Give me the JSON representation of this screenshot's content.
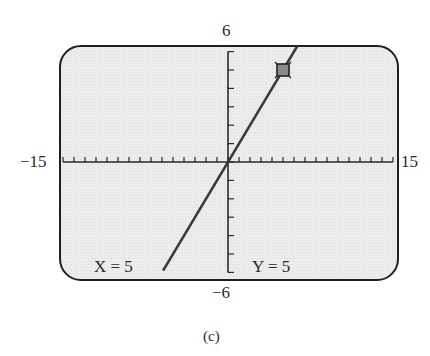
{
  "chart_data": {
    "type": "line",
    "title": "",
    "caption": "(c)",
    "xlabel": "",
    "ylabel": "",
    "xlim": [
      -15,
      15
    ],
    "ylim": [
      -6,
      6
    ],
    "x_tick_step": 1,
    "y_tick_step": 1,
    "grid": false,
    "series": [
      {
        "name": "y = x",
        "x": [
          -6,
          -5,
          0,
          5,
          6
        ],
        "y": [
          -6,
          -5,
          0,
          5,
          6
        ]
      }
    ],
    "cursor": {
      "x": 5,
      "y": 5
    },
    "annotations": [
      "X = 5",
      "Y = 5"
    ]
  },
  "window": {
    "xmin_label": "−15",
    "xmax_label": "15",
    "ymin_label": "−6",
    "ymax_label": "6"
  },
  "trace": {
    "x_readout": "X = 5",
    "y_readout": "Y = 5"
  },
  "caption": "(c)",
  "colors": {
    "screen_bg": "#ececec",
    "frame": "#1f1f1f",
    "line": "#3a3a3a",
    "cursor_fill": "#8a8a8a"
  }
}
